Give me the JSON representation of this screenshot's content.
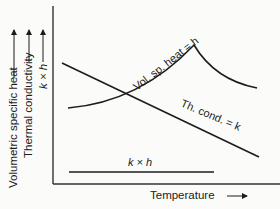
{
  "diagram": {
    "y_axis_labels": [
      "Volumetric specific heat",
      "Thermal conductivity",
      "k × h"
    ],
    "x_axis_label": "Temperature",
    "curves": {
      "vol_sp_heat": "Vol. sp. heat = h",
      "th_cond": "Th. cond. = k",
      "product": "k × h"
    },
    "colors": {
      "line": "#1c1c1c",
      "axis": "#333333",
      "background": "#fbfbf9"
    }
  }
}
